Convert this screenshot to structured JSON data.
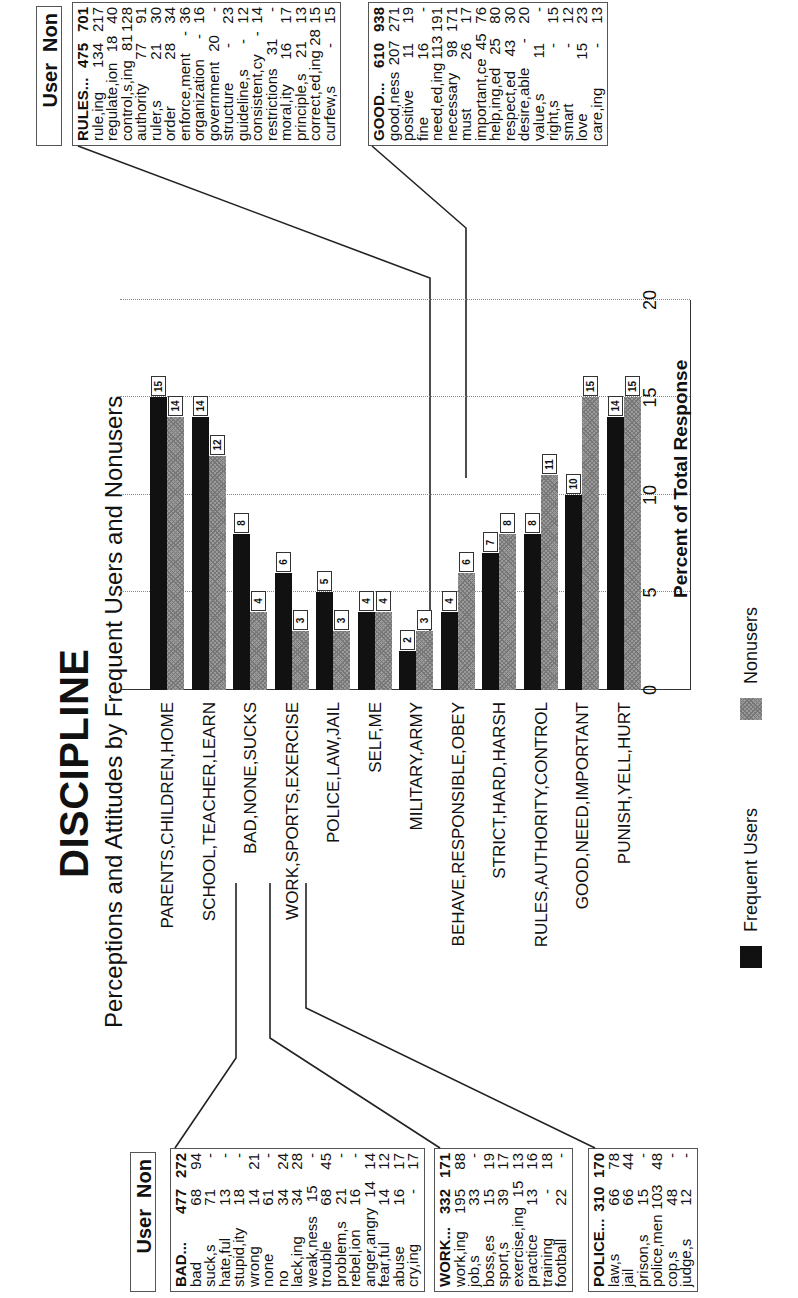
{
  "title": "DISCIPLINE",
  "subtitle": "Perceptions and Attitudes by Frequent Users and Nonusers",
  "chart_data": {
    "type": "bar",
    "orientation": "horizontal (page rotated 90°)",
    "title": "DISCIPLINE",
    "subtitle": "Perceptions and Attitudes by Frequent Users and Nonusers",
    "xlabel": "Percent of Total Response",
    "ylabel": "",
    "xlim": [
      0,
      20
    ],
    "ticks": [
      "0",
      "5",
      "10",
      "15",
      "20"
    ],
    "grid": true,
    "legend_position": "bottom",
    "categories": [
      "PARENTS,CHILDREN,HOME",
      "SCHOOL,TEACHER,LEARN",
      "BAD,NONE,SUCKS",
      "WORK,SPORTS,EXERCISE",
      "POLICE,LAW,JAIL",
      "SELF,ME",
      "MILITARY,ARMY",
      "BEHAVE,RESPONSIBLE,OBEY",
      "STRICT,HARD,HARSH",
      "RULES,AUTHORITY,CONTROL",
      "GOOD,NEED,IMPORTANT",
      "PUNISH,YELL,HURT"
    ],
    "series": [
      {
        "name": "Frequent Users",
        "color": "#111111",
        "values": [
          15,
          14,
          8,
          6,
          5,
          4,
          2,
          4,
          7,
          8,
          10,
          14
        ]
      },
      {
        "name": "Nonusers",
        "color": "#9a9a9a",
        "pattern": "crosshatch",
        "values": [
          14,
          12,
          4,
          3,
          3,
          4,
          3,
          6,
          8,
          11,
          15,
          15
        ]
      }
    ]
  },
  "legend": {
    "users": "Frequent Users",
    "nonusers": "Nonusers"
  },
  "tables": {
    "header_left": {
      "user": "User",
      "non": "Non"
    },
    "header_right": {
      "user": "User",
      "non": "Non"
    },
    "bad": [
      [
        "BAD...",
        "477",
        "272"
      ],
      [
        "bad",
        "68",
        "94"
      ],
      [
        "suck,s",
        "71",
        "-"
      ],
      [
        "hate,ful",
        "13",
        "-"
      ],
      [
        "stupid,ity",
        "18",
        "-"
      ],
      [
        "wrong",
        "14",
        "21"
      ],
      [
        "none",
        "61",
        "-"
      ],
      [
        "no",
        "34",
        "24"
      ],
      [
        "lack,ing",
        "34",
        "28"
      ],
      [
        "weak,ness",
        "15",
        "-"
      ],
      [
        "trouble",
        "68",
        "45"
      ],
      [
        "problem,s",
        "21",
        "-"
      ],
      [
        "rebel,ion",
        "16",
        "-"
      ],
      [
        "anger,angry",
        "14",
        "14"
      ],
      [
        "fear,ful",
        "14",
        "12"
      ],
      [
        "abuse",
        "16",
        "17"
      ],
      [
        "cry,ing",
        "-",
        "17"
      ]
    ],
    "work": [
      [
        "WORK...",
        "332",
        "171"
      ],
      [
        "work,ing",
        "195",
        "88"
      ],
      [
        "job,s",
        "33",
        "-"
      ],
      [
        "boss,es",
        "15",
        "19"
      ],
      [
        "sport,s",
        "39",
        "17"
      ],
      [
        "exercise,ing",
        "15",
        "13"
      ],
      [
        "practice",
        "13",
        "16"
      ],
      [
        "training",
        "-",
        "18"
      ],
      [
        "football",
        "22",
        "-"
      ]
    ],
    "police": [
      [
        "POLICE...",
        "310",
        "170"
      ],
      [
        "law,s",
        "66",
        "78"
      ],
      [
        "jail",
        "66",
        "44"
      ],
      [
        "prison,s",
        "15",
        "-"
      ],
      [
        "police,men",
        "103",
        "48"
      ],
      [
        "cop,s",
        "48",
        "-"
      ],
      [
        "judge,s",
        "12",
        "-"
      ]
    ],
    "rules": [
      [
        "RULES...",
        "475",
        "701"
      ],
      [
        "rule,ing",
        "134",
        "217"
      ],
      [
        "regulate,ion",
        "18",
        "40"
      ],
      [
        "control,s,ing",
        "81",
        "128"
      ],
      [
        "authority",
        "77",
        "91"
      ],
      [
        "ruler,s",
        "21",
        "30"
      ],
      [
        "order",
        "28",
        "34"
      ],
      [
        "enforce,ment",
        "-",
        "36"
      ],
      [
        "organization",
        "-",
        "16"
      ],
      [
        "government",
        "20",
        "-"
      ],
      [
        "structure",
        "-",
        "23"
      ],
      [
        "guideline,s",
        "-",
        "12"
      ],
      [
        "consistent,cy",
        "-",
        "14"
      ],
      [
        "restrictions",
        "31",
        "-"
      ],
      [
        "moral,ity",
        "16",
        "17"
      ],
      [
        "principle,s",
        "21",
        "13"
      ],
      [
        "correct,ed,ing",
        "28",
        "15"
      ],
      [
        "curfew,s",
        "-",
        "15"
      ]
    ],
    "good": [
      [
        "GOOD...",
        "610",
        "938"
      ],
      [
        "good,ness",
        "207",
        "271"
      ],
      [
        "positive",
        "11",
        "19"
      ],
      [
        "fine",
        "16",
        "-"
      ],
      [
        "need,ed,ing",
        "113",
        "191"
      ],
      [
        "necessary",
        "98",
        "171"
      ],
      [
        "must",
        "26",
        "17"
      ],
      [
        "important,ce",
        "45",
        "76"
      ],
      [
        "help,ing,ed",
        "25",
        "80"
      ],
      [
        "respect,ed",
        "43",
        "30"
      ],
      [
        "desire,able",
        "-",
        "20"
      ],
      [
        "value,s",
        "11",
        "-"
      ],
      [
        "right,s",
        "-",
        "15"
      ],
      [
        "smart",
        "-",
        "12"
      ],
      [
        "love",
        "15",
        "23"
      ],
      [
        "care,ing",
        "-",
        "13"
      ]
    ]
  }
}
